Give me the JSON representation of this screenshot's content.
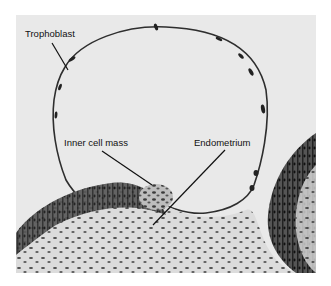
{
  "figure": {
    "type": "grayscale micrograph",
    "background_color": "#e9e9e9",
    "tissue_dark_color": "#2a2a2a",
    "labels": [
      {
        "id": "trophoblast",
        "text": "Trophoblast"
      },
      {
        "id": "inner_cell_mass",
        "text": "Inner cell mass"
      },
      {
        "id": "endometrium",
        "text": "Endometrium"
      }
    ]
  }
}
